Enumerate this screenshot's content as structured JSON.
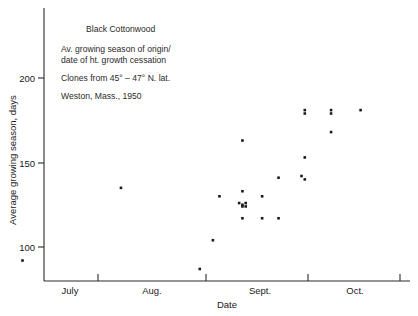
{
  "chart_data": {
    "type": "scatter",
    "title": "Black Cottonwood",
    "annotations": [
      "Black Cottonwood",
      "Av. growing season of origin/",
      "date of ht. growth cessation",
      "Clones from 45° – 47° N. lat.",
      "Weston, Mass., 1950"
    ],
    "xlabel": "Date",
    "ylabel": "Average growing season, days",
    "x_tick_labels": [
      "July",
      "Aug.",
      "Sept.",
      "Oct."
    ],
    "y_tick_labels": [
      "100",
      "150",
      "200"
    ],
    "y_ticks": [
      100,
      150,
      200
    ],
    "ylim": [
      82,
      213
    ],
    "xlim_days": [
      0,
      122
    ],
    "x_month_start_days": {
      "July": 30,
      "Aug.": 61,
      "Sept.": 92,
      "Oct.": 122
    },
    "grid": false,
    "legend": false,
    "marker": "square",
    "marker_color": "#1a1a1a",
    "n_points": 26,
    "points": [
      {
        "x_day": 7,
        "y": 92,
        "date": "Jun 8",
        "label": "p1"
      },
      {
        "x_day": 37,
        "y": 135,
        "date": "Jul 8",
        "label": "p2"
      },
      {
        "x_day": 61,
        "y": 87,
        "date": "Aug 1",
        "label": "p3"
      },
      {
        "x_day": 65,
        "y": 104,
        "date": "Aug 5",
        "label": "p4"
      },
      {
        "x_day": 67,
        "y": 130,
        "date": "Aug 7",
        "label": "p5"
      },
      {
        "x_day": 74,
        "y": 163,
        "date": "Aug 14",
        "label": "p6"
      },
      {
        "x_day": 74,
        "y": 133,
        "date": "Aug 14",
        "label": "p7"
      },
      {
        "x_day": 73,
        "y": 126,
        "date": "Aug 13",
        "label": "p8"
      },
      {
        "x_day": 75,
        "y": 126,
        "date": "Aug 15",
        "label": "p9"
      },
      {
        "x_day": 74,
        "y": 124,
        "date": "Aug 14",
        "label": "p10"
      },
      {
        "x_day": 74,
        "y": 117,
        "date": "Aug 14",
        "label": "p11"
      },
      {
        "x_day": 80,
        "y": 130,
        "date": "Aug 20",
        "label": "p12"
      },
      {
        "x_day": 80,
        "y": 117,
        "date": "Aug 20",
        "label": "p13"
      },
      {
        "x_day": 85,
        "y": 141,
        "date": "Aug 25",
        "label": "p14"
      },
      {
        "x_day": 85,
        "y": 117,
        "date": "Aug 25",
        "label": "p15"
      },
      {
        "x_day": 93,
        "y": 181,
        "date": "Sep 1",
        "label": "p16"
      },
      {
        "x_day": 93,
        "y": 179,
        "date": "Sep 1",
        "label": "p17"
      },
      {
        "x_day": 93,
        "y": 153,
        "date": "Sep 1",
        "label": "p18"
      },
      {
        "x_day": 92,
        "y": 142,
        "date": "Aug 31",
        "label": "p19"
      },
      {
        "x_day": 93,
        "y": 140,
        "date": "Sep 1",
        "label": "p20"
      },
      {
        "x_day": 101,
        "y": 181,
        "date": "Sep 9",
        "label": "p21"
      },
      {
        "x_day": 101,
        "y": 179,
        "date": "Sep 9",
        "label": "p22"
      },
      {
        "x_day": 101,
        "y": 168,
        "date": "Sep 9",
        "label": "p23"
      },
      {
        "x_day": 110,
        "y": 181,
        "date": "Sep 18",
        "label": "p24"
      },
      {
        "x_day": 74,
        "y": 125,
        "date": "Aug 14",
        "label": "p25"
      },
      {
        "x_day": 75,
        "y": 124,
        "date": "Aug 15",
        "label": "p26"
      }
    ]
  },
  "layout": {
    "plot_left": 44,
    "plot_right": 410,
    "plot_bottom": 281,
    "plot_top": 8,
    "y_pixel_200": 78,
    "y_pixel_150": 163,
    "y_pixel_100": 247,
    "x_pixel_tick_july": 98,
    "x_pixel_tick_aug": 206,
    "x_pixel_tick_sept": 308,
    "x_pixel_tick_oct": 400
  }
}
